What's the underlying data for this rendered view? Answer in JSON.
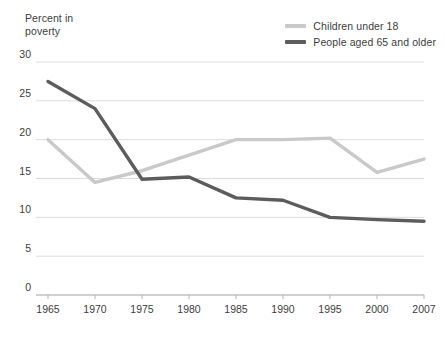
{
  "chart_data": {
    "type": "line",
    "title": "Percent in poverty",
    "xlabel": "",
    "ylabel": "Percent in poverty",
    "x": [
      "1965",
      "1970",
      "1975",
      "1980",
      "1985",
      "1990",
      "1995",
      "2000",
      "2007"
    ],
    "categories": [
      "1965",
      "1970",
      "1975",
      "1980",
      "1985",
      "1990",
      "1995",
      "2000",
      "2007"
    ],
    "series": [
      {
        "name": "Children under 18",
        "color": "#c9c9c9",
        "values": [
          20.0,
          14.5,
          16.0,
          18.0,
          20.0,
          20.0,
          20.2,
          15.8,
          17.5
        ]
      },
      {
        "name": "People aged 65 and older",
        "color": "#5c5c5c",
        "values": [
          27.5,
          24.0,
          14.9,
          15.2,
          12.5,
          12.2,
          10.0,
          9.7,
          9.5
        ]
      }
    ],
    "ylim": [
      0,
      30
    ],
    "yticks": [
      0,
      5,
      10,
      15,
      20,
      25,
      30
    ],
    "ytick_labels": [
      "0",
      "5",
      "10",
      "15",
      "20",
      "25",
      "30"
    ],
    "grid": true,
    "grid_color": "#dcdcdc",
    "legend_position": "top-right",
    "background": "#ffffff"
  },
  "legend": {
    "items": [
      {
        "label": "Children under 18"
      },
      {
        "label": "People aged 65 and older"
      }
    ]
  },
  "axis": {
    "title_text": "Percent in\npoverty"
  }
}
